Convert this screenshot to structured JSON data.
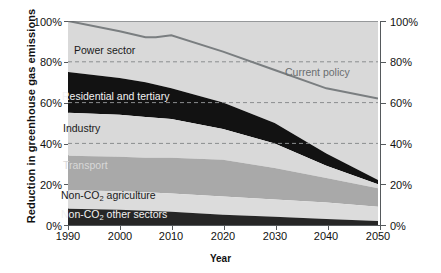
{
  "chart_data": {
    "type": "area",
    "title": "",
    "xlabel": "Year",
    "ylabel": "Reduction in greenhouse gas emissions",
    "xlim": [
      1990,
      2050
    ],
    "ylim": [
      0,
      100
    ],
    "grid": "dashed horizontal gridlines at 40%, 60%, 80%",
    "legend_position": "inline labels inside bands",
    "x": [
      1990,
      2000,
      2005,
      2010,
      2020,
      2030,
      2040,
      2050
    ],
    "xticks": [
      "1990",
      "2000",
      "2010",
      "2020",
      "2030",
      "2040",
      "2050"
    ],
    "yticks_left": [
      "0%",
      "20%",
      "40%",
      "60%",
      "80%",
      "100%"
    ],
    "yticks_right": [
      "0%",
      "20%",
      "40%",
      "60%",
      "80%",
      "100%"
    ],
    "stack_order_bottom_to_top": [
      "Non-CO2 other sectors",
      "Non-CO2 agriculture",
      "Transport",
      "Industry",
      "Residential and tertiary",
      "Power sector"
    ],
    "series": [
      {
        "name": "Non-CO2 other sectors",
        "label": "Non-CO₂ other sectors",
        "color": "#262626",
        "cumulative_top": [
          8,
          7.5,
          7,
          6.5,
          5,
          4,
          3,
          2
        ]
      },
      {
        "name": "Non-CO2 agriculture",
        "label": "Non-CO₂ agriculture",
        "color": "#dcdcdc",
        "cumulative_top": [
          17,
          16.5,
          16,
          15.5,
          14,
          12.5,
          11,
          9
        ]
      },
      {
        "name": "Transport",
        "label": "Transport",
        "color": "#a9a9a9",
        "cumulative_top": [
          34,
          33.5,
          33,
          33,
          32,
          28,
          23,
          18
        ]
      },
      {
        "name": "Industry",
        "label": "Industry",
        "color": "#d9d9d9",
        "cumulative_top": [
          55,
          54,
          53,
          52,
          47,
          40,
          29,
          20
        ]
      },
      {
        "name": "Residential and tertiary",
        "label": "Residential and tertiary",
        "color": "#121212",
        "cumulative_top": [
          75,
          72,
          70,
          67,
          60,
          50,
          35,
          22
        ]
      },
      {
        "name": "Power sector",
        "label": "Power sector",
        "color": "#d9d9d9",
        "cumulative_top": [
          100,
          100,
          100,
          100,
          100,
          100,
          100,
          100
        ]
      }
    ],
    "line_series": {
      "name": "Current policy",
      "label": "Current policy",
      "color": "#7a7e80",
      "x": [
        1990,
        2000,
        2005,
        2007,
        2010,
        2020,
        2030,
        2040,
        2050
      ],
      "y": [
        100,
        95,
        92,
        92,
        93,
        85,
        76,
        67,
        62
      ]
    },
    "annotations": [
      {
        "text": "Current policy",
        "x": 2027,
        "y": 78
      }
    ]
  },
  "axes": {
    "ylabel": "Reduction in greenhouse gas emissions",
    "xlabel": "Year"
  }
}
